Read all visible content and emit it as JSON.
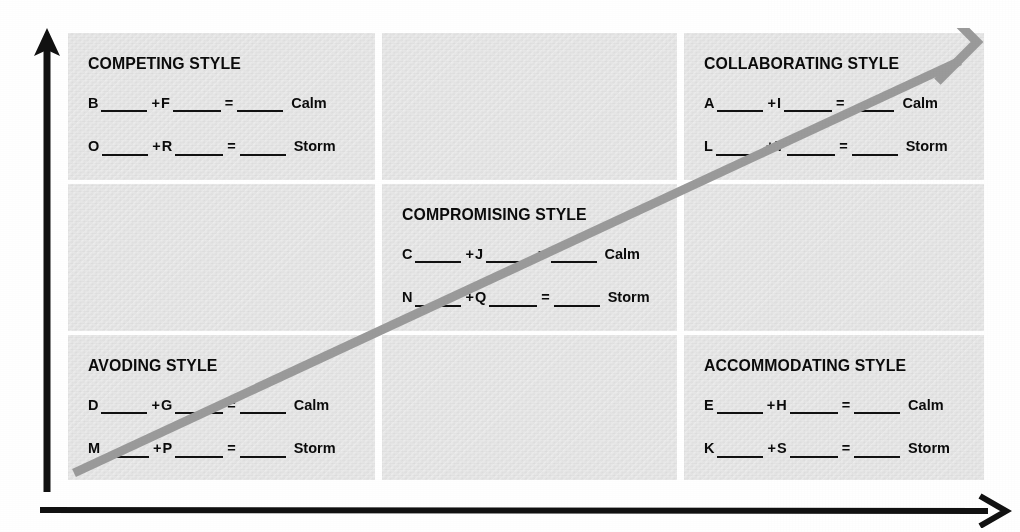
{
  "worksheet": {
    "title": "Conflict Styles Grid",
    "colors": {
      "cell_fill": "#e4e4e4",
      "page_background": "#ffffff",
      "text": "#0b0b0b",
      "axis_arrow": "#111111",
      "diagonal_arrow": "#9a9a9a"
    },
    "equation_symbols": {
      "plus": "+",
      "equals": "=",
      "blank": ""
    },
    "results": {
      "calm": "Calm",
      "storm": "Storm"
    },
    "axes": {
      "vertical_arrow": "up-arrow",
      "horizontal_arrow": "right-arrow",
      "diagonal_arrow": "diagonal-up-right-arrow"
    },
    "cells": [
      {
        "position": "top-left",
        "title": "COMPETING STYLE",
        "empty": false,
        "rows": [
          {
            "left": "B",
            "op": "+",
            "right": "F",
            "eq": "=",
            "result": "Calm"
          },
          {
            "left": "O",
            "op": "+",
            "right": "R",
            "eq": "=",
            "result": "Storm"
          }
        ]
      },
      {
        "position": "top-center",
        "title": "",
        "empty": true,
        "rows": []
      },
      {
        "position": "top-right",
        "title": "COLLABORATING STYLE",
        "empty": false,
        "rows": [
          {
            "left": "A",
            "op": "+",
            "right": "I",
            "eq": "=",
            "result": "Calm"
          },
          {
            "left": "L",
            "op": "+",
            "right": "T",
            "eq": "=",
            "result": "Storm"
          }
        ]
      },
      {
        "position": "middle-left",
        "title": "",
        "empty": true,
        "rows": []
      },
      {
        "position": "middle-center",
        "title": "COMPROMISING STYLE",
        "empty": false,
        "rows": [
          {
            "left": "C",
            "op": "+",
            "right": "J",
            "eq": "=",
            "result": "Calm"
          },
          {
            "left": "N",
            "op": "+",
            "right": "Q",
            "eq": "=",
            "result": "Storm"
          }
        ]
      },
      {
        "position": "middle-right",
        "title": "",
        "empty": true,
        "rows": []
      },
      {
        "position": "bottom-left",
        "title": "AVODING STYLE",
        "empty": false,
        "rows": [
          {
            "left": "D",
            "op": "+",
            "right": "G",
            "eq": "=",
            "result": "Calm"
          },
          {
            "left": "M",
            "op": "+",
            "right": "P",
            "eq": "=",
            "result": "Storm"
          }
        ]
      },
      {
        "position": "bottom-center",
        "title": "",
        "empty": true,
        "rows": []
      },
      {
        "position": "bottom-right",
        "title": "ACCOMMODATING STYLE",
        "empty": false,
        "rows": [
          {
            "left": "E",
            "op": "+",
            "right": "H",
            "eq": "=",
            "result": "Calm"
          },
          {
            "left": "K",
            "op": "+",
            "right": "S",
            "eq": "=",
            "result": "Storm"
          }
        ]
      }
    ]
  }
}
